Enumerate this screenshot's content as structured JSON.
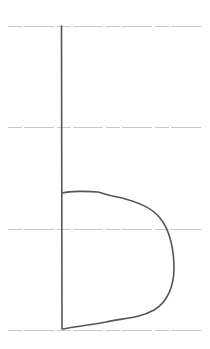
{
  "image": {
    "description": "Handwritten lowercase letter on four-line handwriting guide paper",
    "letter": "b",
    "width": 210,
    "height": 349
  },
  "colors": {
    "background": "#ffffff",
    "guide_line": "#c8c8c8",
    "stroke": "#555555"
  },
  "guide_lines": [
    {
      "name": "top-line",
      "y": 26
    },
    {
      "name": "upper-mid-line",
      "y": 127
    },
    {
      "name": "lower-mid-line",
      "y": 229
    },
    {
      "name": "baseline",
      "y": 330
    }
  ],
  "strokes": {
    "stem": "M61.5 26 L62 329",
    "bowl": "M62 193 C70 191 88 191 98 192 C104 194 110 196 122 198 C140 203 152 208 160 218 C170 230 174 250 174 268 C174 285 168 302 154 310 C140 318 124 318 106 322 C90 325 74 327 63 329"
  }
}
